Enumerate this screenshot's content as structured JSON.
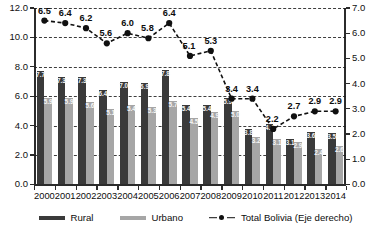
{
  "chart_data": {
    "type": "bar",
    "title": "",
    "subtitle": "",
    "xlabel": "",
    "ylabel": "",
    "categories": [
      "2000",
      "2001",
      "2002",
      "2003",
      "2004",
      "2005",
      "2006",
      "2007",
      "2008",
      "2009",
      "2010",
      "2011",
      "2012",
      "2013",
      "2014"
    ],
    "series": [
      {
        "name": "Rural",
        "type": "bar",
        "axis": "left",
        "color": "#3a3a3a",
        "values": [
          7.7,
          7.3,
          7.3,
          6.4,
          7.0,
          6.9,
          7.8,
          5.4,
          5.4,
          5.9,
          3.8,
          4.1,
          3.1,
          3.6,
          3.5
        ]
      },
      {
        "name": "Urbano",
        "type": "bar",
        "axis": "left",
        "color": "#a6a6a6",
        "values": [
          5.9,
          5.9,
          5.6,
          5.1,
          5.4,
          5.3,
          5.7,
          4.5,
          4.9,
          5.0,
          3.2,
          3.1,
          2.9,
          2.4,
          2.6
        ]
      },
      {
        "name": "Total Bolivia (Eje derecho)",
        "type": "line",
        "axis": "right",
        "color": "#101010",
        "values": [
          6.5,
          6.4,
          6.2,
          5.6,
          6.0,
          5.8,
          6.4,
          5.1,
          5.3,
          3.4,
          3.4,
          2.2,
          2.7,
          2.9,
          2.9
        ]
      }
    ],
    "left_axis": {
      "min": 0.0,
      "max": 12.0,
      "step": 2.0,
      "ticks": [
        "0.0",
        "2.0",
        "4.0",
        "6.0",
        "8.0",
        "10.0",
        "12.0"
      ]
    },
    "right_axis": {
      "min": 0.0,
      "max": 7.0,
      "step": 1.0,
      "ticks": [
        "0.0",
        "1.0",
        "2.0",
        "3.0",
        "4.0",
        "5.0",
        "6.0",
        "7.0"
      ]
    },
    "grid": true,
    "grid_style": "dashed",
    "legend_position": "bottom",
    "legend": [
      "Rural",
      "Urbano",
      "Total Bolivia (Eje derecho)"
    ]
  }
}
